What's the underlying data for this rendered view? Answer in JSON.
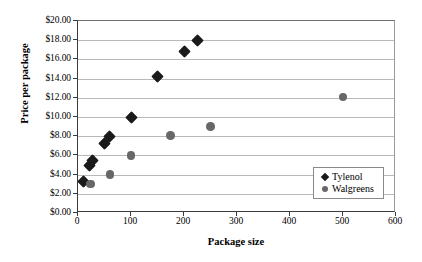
{
  "chart_data": {
    "type": "scatter",
    "title": "",
    "xlabel": "Package size",
    "ylabel": "Price per package",
    "xlim": [
      0,
      600
    ],
    "ylim": [
      0,
      20
    ],
    "grid": "horizontal",
    "legend_position": "inside-bottom-right",
    "x_ticks": [
      "0",
      "100",
      "200",
      "300",
      "400",
      "500",
      "600"
    ],
    "x_tick_values": [
      0,
      100,
      200,
      300,
      400,
      500,
      600
    ],
    "y_ticks": [
      "$0.00",
      "$2.00",
      "$4.00",
      "$6.00",
      "$8.00",
      "$10.00",
      "$12.00",
      "$14.00",
      "$16.00",
      "$18.00",
      "$20.00"
    ],
    "y_tick_values": [
      0,
      2,
      4,
      6,
      8,
      10,
      12,
      14,
      16,
      18,
      20
    ],
    "series": [
      {
        "name": "Tylenol",
        "marker": "diamond",
        "color": "#1a1a1a",
        "points": [
          {
            "x": 10,
            "y": 3.3
          },
          {
            "x": 22,
            "y": 5.0
          },
          {
            "x": 27,
            "y": 5.45
          },
          {
            "x": 50,
            "y": 7.2
          },
          {
            "x": 60,
            "y": 7.95
          },
          {
            "x": 100,
            "y": 10.0
          },
          {
            "x": 150,
            "y": 14.25
          },
          {
            "x": 200,
            "y": 16.8
          },
          {
            "x": 225,
            "y": 17.95
          }
        ]
      },
      {
        "name": "Walgreens",
        "marker": "circle",
        "color": "#676767",
        "points": [
          {
            "x": 24,
            "y": 3.0
          },
          {
            "x": 60,
            "y": 4.0
          },
          {
            "x": 100,
            "y": 6.0
          },
          {
            "x": 175,
            "y": 8.05
          },
          {
            "x": 250,
            "y": 9.0
          },
          {
            "x": 500,
            "y": 12.1
          }
        ]
      }
    ]
  },
  "legend": {
    "items": [
      {
        "label": "Tylenol"
      },
      {
        "label": "Walgreens"
      }
    ]
  }
}
